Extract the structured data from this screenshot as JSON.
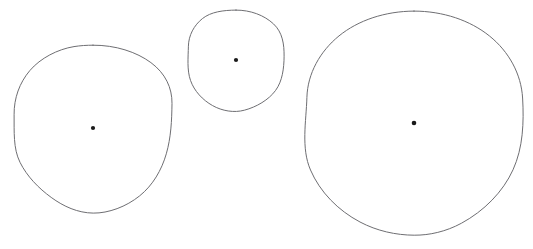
{
  "figure": {
    "background_color": "#ffffff",
    "width": 533,
    "height": 249,
    "stroke_color": "#6e6e72",
    "dot_color": "#1a1a1a",
    "stroke_width": 1
  },
  "chart_data": {
    "type": "scatter",
    "xlabel": "",
    "ylabel": "",
    "xlim": [
      0,
      533
    ],
    "ylim": [
      0,
      249
    ],
    "grid": false,
    "legend": "none",
    "shapes": [
      {
        "name": "small-circle",
        "label": "Small circle",
        "cx": 236,
        "cy": 61,
        "rx": 48,
        "ry": 51,
        "dot_cx": 236,
        "dot_cy": 60,
        "dot_r": 2.1
      },
      {
        "name": "medium-circle",
        "label": "Medium circle",
        "cx": 93,
        "cy": 129,
        "rx": 79,
        "ry": 84,
        "dot_cx": 93,
        "dot_cy": 128,
        "dot_r": 2.1
      },
      {
        "name": "large-circle",
        "label": "Large circle",
        "cx": 414,
        "cy": 123,
        "rx": 108,
        "ry": 112,
        "dot_cx": 414,
        "dot_cy": 123,
        "dot_r": 2.3
      }
    ]
  }
}
